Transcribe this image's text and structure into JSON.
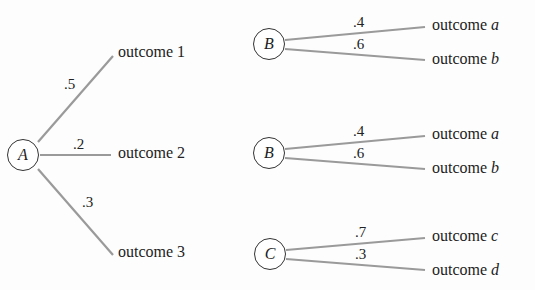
{
  "diagram": {
    "type": "decision-tree",
    "tree_a": {
      "node": "A",
      "branches": [
        {
          "prob": ".5",
          "outcome": "outcome 1"
        },
        {
          "prob": ".2",
          "outcome": "outcome 2"
        },
        {
          "prob": ".3",
          "outcome": "outcome 3"
        }
      ]
    },
    "tree_b1": {
      "node": "B",
      "branches": [
        {
          "prob": ".4",
          "outcome_prefix": "outcome ",
          "outcome_var": "a"
        },
        {
          "prob": ".6",
          "outcome_prefix": "outcome ",
          "outcome_var": "b"
        }
      ]
    },
    "tree_b2": {
      "node": "B",
      "branches": [
        {
          "prob": ".4",
          "outcome_prefix": "outcome ",
          "outcome_var": "a"
        },
        {
          "prob": ".6",
          "outcome_prefix": "outcome ",
          "outcome_var": "b"
        }
      ]
    },
    "tree_c": {
      "node": "C",
      "branches": [
        {
          "prob": ".7",
          "outcome_prefix": "outcome ",
          "outcome_var": "c"
        },
        {
          "prob": ".3",
          "outcome_prefix": "outcome ",
          "outcome_var": "d"
        }
      ]
    },
    "colors": {
      "line": "#9a9a9a",
      "node_border": "#333333",
      "text": "#222222"
    }
  }
}
